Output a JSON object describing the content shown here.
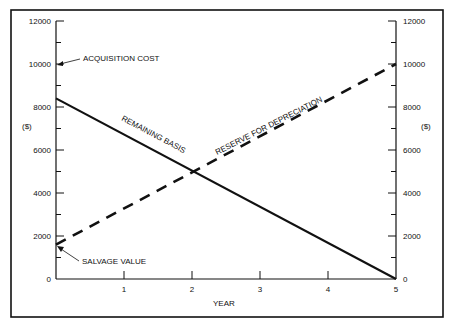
{
  "chart_data": {
    "type": "line",
    "title": "",
    "xlabel": "YEAR",
    "ylabel_left": "($)",
    "ylabel_right": "($)",
    "xlim": [
      0,
      5
    ],
    "ylim": [
      0,
      12000
    ],
    "x_ticks": [
      "1",
      "2",
      "3",
      "4",
      "5"
    ],
    "y_ticks": [
      "0",
      "2000",
      "4000",
      "6000",
      "8000",
      "10000",
      "12000"
    ],
    "grid": false,
    "series": [
      {
        "name": "REMAINING BASIS",
        "style": "solid",
        "x": [
          0,
          5
        ],
        "values": [
          8400,
          0
        ]
      },
      {
        "name": "RESERVE FOR DEPRECIATION",
        "style": "dashed",
        "x": [
          0,
          5
        ],
        "values": [
          1600,
          10000
        ]
      }
    ],
    "annotations": [
      {
        "text": "ACQUISITION COST",
        "x": 0,
        "y": 10000
      },
      {
        "text": "SALVAGE VALUE",
        "x": 0,
        "y": 1600
      }
    ]
  }
}
